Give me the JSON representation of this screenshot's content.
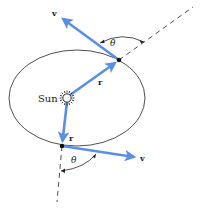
{
  "diagram": {
    "type": "orbital-mechanics",
    "colors": {
      "vector": "#5b8fe0",
      "line": "#222222",
      "background": "#ffffff"
    },
    "labels": {
      "sun": "Sun",
      "upper_velocity": "v",
      "upper_radius": "r",
      "upper_angle": "θ",
      "lower_velocity": "v",
      "lower_radius": "r",
      "lower_angle": "θ"
    },
    "elements": {
      "orbit": {
        "shape": "ellipse",
        "cx": 77,
        "cy": 98,
        "rx": 68,
        "ry": 48
      },
      "sun": {
        "x": 67,
        "y": 98
      },
      "point_upper": {
        "x": 119,
        "y": 60
      },
      "point_lower": {
        "x": 62,
        "y": 146
      }
    }
  }
}
